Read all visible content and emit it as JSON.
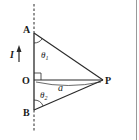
{
  "diagram": {
    "type": "physics-geometry",
    "points": {
      "A": {
        "label": "A",
        "x": 34,
        "y": 33
      },
      "O": {
        "label": "O",
        "x": 34,
        "y": 80
      },
      "B": {
        "label": "B",
        "x": 34,
        "y": 110
      },
      "P": {
        "label": "P",
        "x": 103,
        "y": 80
      }
    },
    "current_label": "I",
    "current_direction": "up",
    "angles": {
      "theta1": {
        "label": "θ",
        "subscript": "1",
        "at": "A"
      },
      "theta2": {
        "label": "θ",
        "subscript": "2",
        "at": "B"
      }
    },
    "distance_label": "a",
    "right_angle_at": "O",
    "colors": {
      "line": "#2a2a2a",
      "background": "#ffffff",
      "border": "#9a9a9a"
    }
  }
}
